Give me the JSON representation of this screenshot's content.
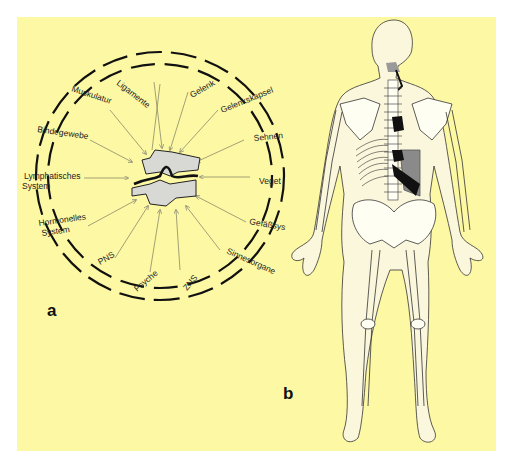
{
  "figure": {
    "background_color": "#fdf8a3",
    "panel_a": {
      "label": "a",
      "center": "vertebra-segment",
      "labels": {
        "ligamente": "Ligamente",
        "gelenk": "Gelenk",
        "gelenkskapsel": "Gelenkskapsel",
        "sehnen": "Sehnen",
        "veget": "Veget",
        "gefaessys": "Gefäßsys",
        "sinnesorgane": "Sinnesorgane",
        "zns": "ZNS",
        "psyche": "Psyche",
        "pns": "PNS",
        "hormonelles1": "Hormonelles",
        "hormonelles2": "System",
        "lymph1": "Lymphatisches",
        "lymph2": "System",
        "bindegewebe": "Bindegewebe",
        "muskulatur": "Muskulatur"
      }
    },
    "panel_b": {
      "label": "b",
      "subject": "skeleton-posterior-view",
      "highlight_colors": {
        "dark": "#111111",
        "gray": "#8a8a8a"
      }
    }
  }
}
